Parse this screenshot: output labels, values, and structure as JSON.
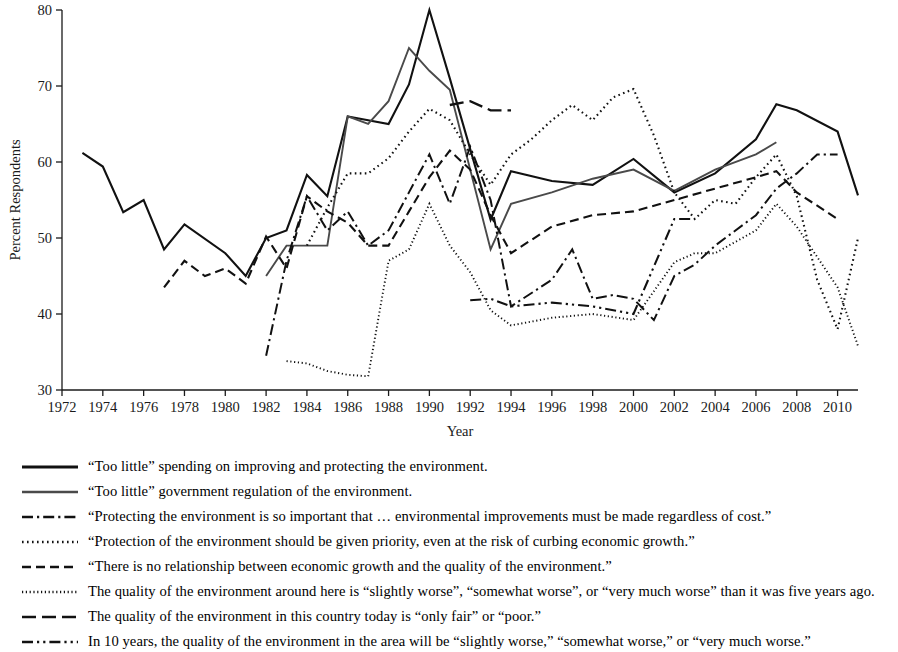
{
  "chart_data": {
    "type": "line",
    "title": "",
    "xlabel": "Year",
    "ylabel": "Percent Respondents",
    "xlim": [
      1972,
      2011
    ],
    "ylim": [
      30,
      80
    ],
    "yticks": [
      30,
      40,
      50,
      60,
      70,
      80
    ],
    "xticks": [
      1972,
      1974,
      1976,
      1978,
      1980,
      1982,
      1984,
      1986,
      1988,
      1990,
      1992,
      1994,
      1996,
      1998,
      2000,
      2002,
      2004,
      2006,
      2008,
      2010
    ],
    "grid": false,
    "legend_position": "below",
    "series": [
      {
        "name": "too-little-spending",
        "label": "“Too little” spending on improving and protecting the environment.",
        "style": "solid",
        "color": "#111111",
        "width": 2.1,
        "points": [
          [
            1973,
            61.2
          ],
          [
            1974,
            59.4
          ],
          [
            1975,
            53.4
          ],
          [
            1976,
            55.0
          ],
          [
            1977,
            48.5
          ],
          [
            1978,
            51.8
          ],
          [
            1980,
            48.0
          ],
          [
            1981,
            45.0
          ],
          [
            1982,
            50.0
          ],
          [
            1983,
            51.0
          ],
          [
            1984,
            58.3
          ],
          [
            1985,
            55.5
          ],
          [
            1986,
            66.0
          ],
          [
            1987,
            65.5
          ],
          [
            1988,
            65.0
          ],
          [
            1989,
            70.2
          ],
          [
            1990,
            80.0
          ],
          [
            1991,
            71.0
          ],
          [
            1993,
            52.4
          ],
          [
            1994,
            58.8
          ],
          [
            1996,
            57.5
          ],
          [
            1998,
            57.0
          ],
          [
            2000,
            60.4
          ],
          [
            2002,
            56.0
          ],
          [
            2004,
            58.5
          ],
          [
            2006,
            63.0
          ],
          [
            2007,
            67.6
          ],
          [
            2008,
            66.8
          ],
          [
            2010,
            64.0
          ],
          [
            2011,
            55.6
          ]
        ]
      },
      {
        "name": "too-little-regulation",
        "label": "“Too little”  government regulation of the environment.",
        "style": "solid",
        "color": "#4a4a4a",
        "width": 1.9,
        "points": [
          [
            1982,
            45.0
          ],
          [
            1983,
            49.0
          ],
          [
            1984,
            49.0
          ],
          [
            1985,
            49.0
          ],
          [
            1986,
            66.0
          ],
          [
            1987,
            65.0
          ],
          [
            1988,
            68.0
          ],
          [
            1989,
            75.0
          ],
          [
            1990,
            72.0
          ],
          [
            1991,
            69.5
          ],
          [
            1993,
            48.5
          ],
          [
            1994,
            54.5
          ],
          [
            1996,
            56.0
          ],
          [
            1998,
            57.8
          ],
          [
            2000,
            59.0
          ],
          [
            2002,
            56.2
          ],
          [
            2004,
            59.0
          ],
          [
            2006,
            61.0
          ],
          [
            2007,
            62.6
          ]
        ]
      },
      {
        "name": "protecting-regardless-of-cost",
        "label": "“Protecting the environment is so important that … environmental improvements must be made regardless of cost.”",
        "style": "dashdot",
        "color": "#111111",
        "width": 2.0,
        "points": [
          [
            1982,
            34.5
          ],
          [
            1983,
            47.0
          ],
          [
            1984,
            55.5
          ],
          [
            1985,
            51.0
          ],
          [
            1986,
            53.5
          ],
          [
            1987,
            49.0
          ],
          [
            1988,
            51.0
          ],
          [
            1989,
            56.0
          ],
          [
            1990,
            61.0
          ],
          [
            1991,
            54.5
          ],
          [
            1992,
            62.0
          ],
          [
            1993,
            55.0
          ],
          [
            1994,
            41.0
          ],
          [
            1996,
            44.5
          ],
          [
            1997,
            48.5
          ],
          [
            1998,
            42.0
          ],
          [
            1999,
            42.5
          ],
          [
            2000,
            42.0
          ],
          [
            2001,
            39.2
          ],
          [
            2002,
            45.0
          ],
          [
            2003,
            46.5
          ],
          [
            2004,
            49.0
          ],
          [
            2006,
            53.0
          ],
          [
            2007,
            56.5
          ],
          [
            2008,
            58.5
          ],
          [
            2009,
            61.0
          ],
          [
            2010,
            61.0
          ]
        ]
      },
      {
        "name": "priority-over-economic-growth",
        "label": "“Protection of the environment should be given priority, even at the risk of curbing economic growth.”",
        "style": "dotted-fine",
        "color": "#111111",
        "width": 2.1,
        "points": [
          [
            1984,
            49.0
          ],
          [
            1985,
            54.0
          ],
          [
            1986,
            58.5
          ],
          [
            1987,
            58.5
          ],
          [
            1988,
            60.5
          ],
          [
            1989,
            64.0
          ],
          [
            1990,
            67.0
          ],
          [
            1991,
            65.5
          ],
          [
            1992,
            61.0
          ],
          [
            1993,
            57.0
          ],
          [
            1994,
            61.0
          ],
          [
            1995,
            63.0
          ],
          [
            1996,
            65.5
          ],
          [
            1997,
            67.5
          ],
          [
            1998,
            65.5
          ],
          [
            1999,
            68.5
          ],
          [
            2000,
            69.6
          ],
          [
            2001,
            63.5
          ],
          [
            2002,
            56.0
          ],
          [
            2003,
            52.5
          ],
          [
            2004,
            55.0
          ],
          [
            2005,
            54.5
          ],
          [
            2006,
            58.0
          ],
          [
            2007,
            61.0
          ],
          [
            2008,
            55.5
          ],
          [
            2009,
            44.5
          ],
          [
            2010,
            38.0
          ],
          [
            2011,
            50.0
          ]
        ]
      },
      {
        "name": "no-relationship-growth-quality",
        "label": "“There is no relationship between economic growth and the quality of the environment.”",
        "style": "dashed",
        "color": "#111111",
        "width": 2.1,
        "points": [
          [
            1977,
            43.5
          ],
          [
            1978,
            47.0
          ],
          [
            1979,
            45.0
          ],
          [
            1980,
            46.0
          ],
          [
            1981,
            44.0
          ],
          [
            1982,
            50.2
          ],
          [
            1983,
            46.0
          ],
          [
            1984,
            55.5
          ],
          [
            1985,
            53.5
          ],
          [
            1986,
            52.0
          ],
          [
            1987,
            49.0
          ],
          [
            1988,
            49.0
          ],
          [
            1989,
            53.5
          ],
          [
            1990,
            58.0
          ],
          [
            1991,
            61.5
          ],
          [
            1992,
            59.0
          ],
          [
            1993,
            53.0
          ],
          [
            1994,
            48.0
          ],
          [
            1996,
            51.5
          ],
          [
            1998,
            53.0
          ],
          [
            2000,
            53.5
          ],
          [
            2002,
            55.0
          ],
          [
            2004,
            56.5
          ],
          [
            2006,
            58.0
          ],
          [
            2007,
            58.8
          ],
          [
            2008,
            56.0
          ],
          [
            2010,
            52.5
          ]
        ]
      },
      {
        "name": "quality-around-here-worse",
        "label": "The quality of the environment around here is “slightly worse”, “somewhat worse”, or “very much worse” than it was five years ago.",
        "style": "dotted-tiny",
        "color": "#111111",
        "width": 1.9,
        "points": [
          [
            1983,
            33.8
          ],
          [
            1984,
            33.5
          ],
          [
            1985,
            32.5
          ],
          [
            1986,
            32.0
          ],
          [
            1987,
            31.8
          ],
          [
            1988,
            47.0
          ],
          [
            1989,
            48.5
          ],
          [
            1990,
            54.5
          ],
          [
            1991,
            49.0
          ],
          [
            1992,
            45.5
          ],
          [
            1993,
            40.5
          ],
          [
            1994,
            38.5
          ],
          [
            1996,
            39.5
          ],
          [
            1998,
            40.0
          ],
          [
            2000,
            39.2
          ],
          [
            2002,
            46.8
          ],
          [
            2003,
            48.0
          ],
          [
            2004,
            48.0
          ],
          [
            2006,
            51.0
          ],
          [
            2007,
            54.5
          ],
          [
            2008,
            51.5
          ],
          [
            2010,
            43.5
          ],
          [
            2011,
            35.8
          ]
        ]
      },
      {
        "name": "quality-country-only-fair-poor",
        "label": "The quality of the environment in this country today is “only fair” or “poor.”",
        "style": "dashed-long",
        "color": "#111111",
        "width": 2.3,
        "points": [
          [
            1991,
            67.5
          ],
          [
            1992,
            68.0
          ],
          [
            1993,
            66.8
          ],
          [
            1994,
            66.8
          ]
        ]
      },
      {
        "name": "in-10-years-worse",
        "label": "In 10 years, the quality of the environment in the area will be “slightly worse,” “somewhat worse,” or “very much worse.”",
        "style": "dashdotdot",
        "color": "#111111",
        "width": 2.1,
        "points": [
          [
            1992,
            41.8
          ],
          [
            1993,
            42.0
          ],
          [
            1994,
            41.0
          ],
          [
            1996,
            41.5
          ],
          [
            1998,
            41.0
          ],
          [
            2000,
            40.0
          ],
          [
            2002,
            52.5
          ],
          [
            2003,
            52.5
          ]
        ]
      }
    ]
  },
  "legend": {
    "items": [
      {
        "style": "solid-thick",
        "label": "“Too little” spending on improving and protecting the environment."
      },
      {
        "style": "solid-gray",
        "label": "“Too little”  government regulation of the environment."
      },
      {
        "style": "dashdot",
        "label": "“Protecting the environment is so important that … environmental improvements must be made regardless of cost.”"
      },
      {
        "style": "dotted-fine",
        "label": "“Protection of the environment should be given priority, even at the risk of curbing economic growth.”"
      },
      {
        "style": "dashed",
        "label": "“There is no relationship between economic growth and the quality of the environment.”"
      },
      {
        "style": "dotted-tiny",
        "label": "The quality of the environment around here is “slightly worse”, “somewhat worse”, or “very much worse” than it was five years ago."
      },
      {
        "style": "dashed-long",
        "label": "The quality of the environment in this country today is “only fair” or “poor.”"
      },
      {
        "style": "dashdotdot",
        "label": "In 10 years, the quality of the environment in the area will be “slightly worse,” “somewhat worse,” or “very much worse.”"
      }
    ]
  }
}
